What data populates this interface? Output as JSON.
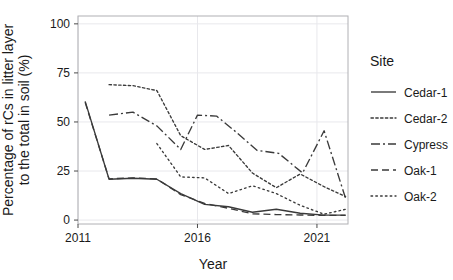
{
  "chart_data": {
    "type": "line",
    "title": "",
    "xlabel": "Year",
    "ylabel": "Percentage of rCs in litter layer\nto the total in soil (%)",
    "ylabel_line1": "Percentage of rCs in litter layer",
    "ylabel_line2": "to the total in soil (%)",
    "xlim": [
      2011.0,
      2022.3
    ],
    "ylim": [
      -2,
      104
    ],
    "xticks": [
      2011,
      2016,
      2021
    ],
    "xtick_labels": [
      "2011",
      "2016",
      "2021"
    ],
    "yticks": [
      0,
      25,
      50,
      75,
      100
    ],
    "ytick_labels": [
      "0",
      "25",
      "50",
      "75",
      "100"
    ],
    "grid": true,
    "grid_color": "#e8e8ec",
    "panel_border_color": "#b0b0b4",
    "line_color": "#3a3a3a",
    "legend_position": "right",
    "legend_title": "Site",
    "series": [
      {
        "name": "Cedar-1",
        "dash": "solid",
        "x": [
          2011.3,
          2012.3,
          2013.3,
          2014.3,
          2015.3,
          2016.3,
          2017.3,
          2018.3,
          2019.3,
          2020.3,
          2021.3,
          2022.2
        ],
        "values": [
          60.5,
          20.8,
          21.3,
          20.8,
          13.5,
          8.0,
          6.8,
          4.0,
          5.5,
          3.5,
          2.5,
          2.5
        ]
      },
      {
        "name": "Cedar-2",
        "dash": "dotted-dense",
        "x": [
          2012.3,
          2013.3,
          2014.3,
          2015.3,
          2016.3,
          2017.3,
          2018.3,
          2019.3,
          2020.3,
          2021.3,
          2022.2
        ],
        "values": [
          69.0,
          68.5,
          66.0,
          43.0,
          36.0,
          38.0,
          24.0,
          16.5,
          23.5,
          17.0,
          12.0
        ]
      },
      {
        "name": "Cypress",
        "dash": "dashdot",
        "x": [
          2012.3,
          2013.3,
          2014.3,
          2015.3,
          2016.0,
          2016.8,
          2017.6,
          2018.5,
          2019.4,
          2020.4,
          2021.3,
          2022.2
        ],
        "values": [
          53.5,
          55.0,
          48.0,
          36.0,
          53.5,
          53.0,
          45.0,
          35.5,
          34.0,
          24.0,
          45.5,
          11.0
        ]
      },
      {
        "name": "Oak-1",
        "dash": "dashed",
        "x": [
          2011.3,
          2012.3,
          2013.3,
          2014.3,
          2015.3,
          2016.3,
          2017.3,
          2018.3,
          2019.3,
          2020.3,
          2021.3,
          2022.2
        ],
        "values": [
          60.0,
          21.0,
          21.5,
          21.0,
          13.0,
          8.5,
          6.0,
          3.2,
          2.8,
          2.6,
          2.4,
          2.4
        ]
      },
      {
        "name": "Oak-2",
        "dash": "dotted",
        "x": [
          2014.3,
          2015.3,
          2016.3,
          2017.3,
          2018.3,
          2019.3,
          2020.3,
          2021.3,
          2022.2
        ],
        "values": [
          39.0,
          22.0,
          21.5,
          13.5,
          17.5,
          13.5,
          7.5,
          3.0,
          5.5
        ]
      }
    ]
  },
  "legend": {
    "title": "Site",
    "items": [
      {
        "label": "Cedar-1",
        "dash": "solid"
      },
      {
        "label": "Cedar-2",
        "dash": "dotted-dense"
      },
      {
        "label": "Cypress",
        "dash": "dashdot"
      },
      {
        "label": "Oak-1",
        "dash": "dashed"
      },
      {
        "label": "Oak-2",
        "dash": "dotted"
      }
    ]
  }
}
